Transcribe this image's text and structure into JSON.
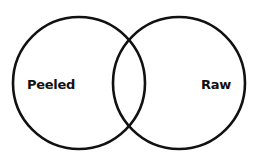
{
  "diagram": {
    "type": "venn",
    "title_cropped": "",
    "stroke_color": "#111111",
    "background": "#ffffff",
    "sets": [
      {
        "label": "Peeled",
        "cx": 79,
        "cy": 83,
        "r": 67
      },
      {
        "label": "Raw",
        "cx": 179,
        "cy": 83,
        "r": 67
      }
    ]
  }
}
